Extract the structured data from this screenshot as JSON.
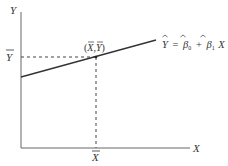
{
  "diagram": {
    "type": "regression-line-through-means",
    "axes": {
      "y_label": "Y",
      "x_label": "X"
    },
    "mean_labels": {
      "y_bar": "Y",
      "x_bar": "X"
    },
    "point_label": "(X,Y)",
    "equation": {
      "lhs": "Y",
      "equals": "=",
      "b0": "β",
      "b0_sub": "0",
      "plus": "+",
      "b1": "β",
      "b1_sub": "1",
      "var": "X"
    },
    "colors": {
      "axis": "#555555",
      "line": "#333333",
      "dash": "#444444",
      "text": "#333333"
    }
  }
}
